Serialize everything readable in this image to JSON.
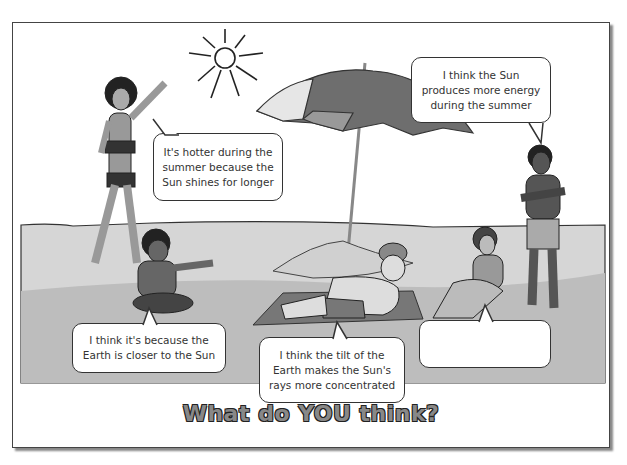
{
  "speech_bubbles": [
    {
      "id": "girl-standing",
      "text": "It's hotter during the summer because the Sun shines for longer"
    },
    {
      "id": "boy-standing",
      "text": "I think the Sun produces more energy during the summer"
    },
    {
      "id": "boy-sitting",
      "text": "I think it's because the Earth is closer to the Sun"
    },
    {
      "id": "man-lying",
      "text": "I think the tilt of the Earth makes the Sun's rays more concentrated"
    },
    {
      "id": "girl-sitting",
      "text": ""
    }
  ],
  "title": "What do YOU think?",
  "colors": {
    "sand_light": "#d6d6d6",
    "sand_dark": "#bcbcbc",
    "outline": "#333333",
    "skin_dark": "#5a5a5a",
    "umbrella_dark": "#6e6e6e",
    "umbrella_light": "#e6e6e6"
  }
}
